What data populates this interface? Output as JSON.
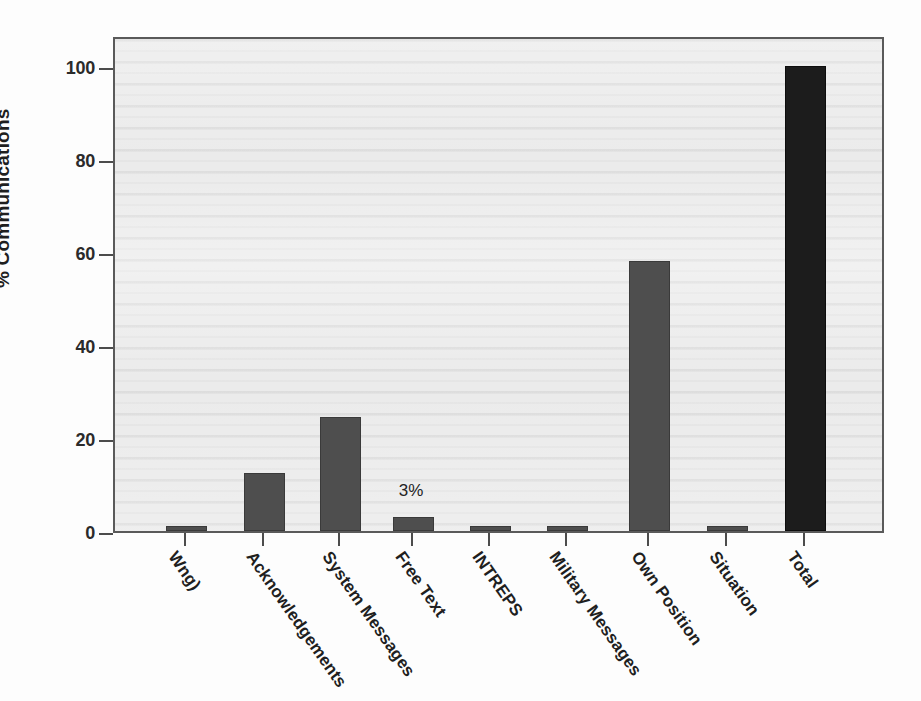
{
  "chart_data": {
    "type": "bar",
    "title": "",
    "xlabel": "",
    "ylabel": "% Communications",
    "ylim": [
      0,
      100
    ],
    "yticks": [
      0,
      20,
      40,
      60,
      80,
      100
    ],
    "ytick_labels": [
      "0",
      "20",
      "40",
      "60",
      "80",
      "100"
    ],
    "grid": false,
    "legend": "none",
    "categories": [
      "Wng)",
      "Acknowledgements",
      "System Messages",
      "Free Text",
      "INTREPS",
      "Military Messages",
      "Own Position",
      "Situation",
      "Total"
    ],
    "values": [
      1,
      12.5,
      24.5,
      3,
      1,
      1,
      58,
      1,
      100
    ],
    "bar_colors": [
      "#4e4e4e",
      "#4e4e4e",
      "#4e4e4e",
      "#4e4e4e",
      "#4e4e4e",
      "#4e4e4e",
      "#4e4e4e",
      "#4e4e4e",
      "#1c1c1c"
    ],
    "annotations": [
      {
        "category": "Free Text",
        "text": "3%"
      }
    ],
    "plot_background": "#ebebeb",
    "axis_color": "#4c4c4c"
  }
}
